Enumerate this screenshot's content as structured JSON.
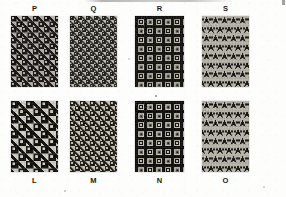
{
  "figure": {
    "caption": "Fig. 147.",
    "background_color": "#fdfdfb",
    "ink_color": "#1a1a1a",
    "width": 286,
    "height": 197,
    "plate_description": "Plate of eight woven fabric swatches, four in the top row labelled above and four in the bottom row labelled below."
  },
  "swatches": [
    {
      "id": "P",
      "label": "P",
      "label_position": "above",
      "row": "top",
      "column": 1,
      "x": 11,
      "y": 16,
      "width": 47,
      "height": 71,
      "pattern": "houndstooth",
      "scale_px": 11,
      "dark_color": "#22211f",
      "light_color": "#b4b1a9",
      "mid_color": "#6a6862",
      "angle_deg": 0
    },
    {
      "id": "Q",
      "label": "Q",
      "label_position": "above",
      "row": "top",
      "column": 2,
      "x": 70,
      "y": 16,
      "width": 47,
      "height": 71,
      "pattern": "houndstooth",
      "scale_px": 8,
      "dark_color": "#2b2a27",
      "light_color": "#bfbcb3",
      "mid_color": "#757369",
      "angle_deg": 0
    },
    {
      "id": "R",
      "label": "R",
      "label_position": "above",
      "row": "top",
      "column": 3,
      "x": 135,
      "y": 16,
      "width": 49,
      "height": 71,
      "pattern": "check",
      "scale_px": 9,
      "dark_color": "#1d1c1a",
      "light_color": "#c2bfb6",
      "mid_color": "#6f6d66",
      "angle_deg": 0
    },
    {
      "id": "S",
      "label": "S",
      "label_position": "above",
      "row": "top",
      "column": 4,
      "x": 202,
      "y": 16,
      "width": 47,
      "height": 71,
      "pattern": "houndstooth-vertical",
      "scale_px": 9,
      "dark_color": "#232220",
      "light_color": "#b9b6ad",
      "mid_color": "#6c6a63",
      "angle_deg": 0
    },
    {
      "id": "L",
      "label": "L",
      "label_position": "below",
      "row": "bottom",
      "column": 1,
      "x": 11,
      "y": 101,
      "width": 47,
      "height": 71,
      "pattern": "houndstooth",
      "scale_px": 15,
      "dark_color": "#1b1a18",
      "light_color": "#cdcac1",
      "mid_color": "#75736c",
      "angle_deg": 0
    },
    {
      "id": "M",
      "label": "M",
      "label_position": "below",
      "row": "bottom",
      "column": 2,
      "x": 70,
      "y": 101,
      "width": 47,
      "height": 71,
      "pattern": "houndstooth",
      "scale_px": 10,
      "dark_color": "#26251f",
      "light_color": "#c5c2b7",
      "mid_color": "#7a776e",
      "angle_deg": 0
    },
    {
      "id": "N",
      "label": "N",
      "label_position": "below",
      "row": "bottom",
      "column": 3,
      "x": 135,
      "y": 101,
      "width": 49,
      "height": 71,
      "pattern": "check",
      "scale_px": 9,
      "dark_color": "#1a1917",
      "light_color": "#c9c6bd",
      "mid_color": "#6d6b64",
      "angle_deg": 0
    },
    {
      "id": "O",
      "label": "O",
      "label_position": "below",
      "row": "bottom",
      "column": 4,
      "x": 202,
      "y": 101,
      "width": 47,
      "height": 71,
      "pattern": "houndstooth-vertical",
      "scale_px": 9,
      "dark_color": "#201f1d",
      "light_color": "#bbb8af",
      "mid_color": "#6e6c65",
      "angle_deg": 0
    }
  ]
}
